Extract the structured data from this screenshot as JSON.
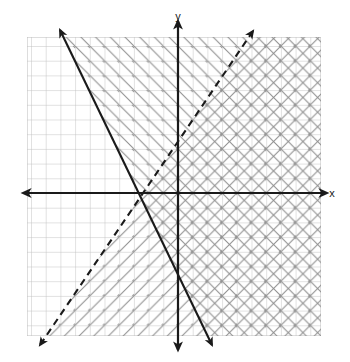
{
  "figure": {
    "title": "",
    "axis_labels": {
      "x": "x",
      "y": "y"
    },
    "background_color": "#ffffff",
    "grid_color": "#b9b9b9",
    "axis_color": "#1a1a1a",
    "shading_color_a": "#8a8a8a",
    "shading_color_b": "#8a8a8a",
    "solid_line_color": "#1a1a1a",
    "dashed_line_color": "#1a1a1a"
  },
  "chart_data": {
    "type": "line",
    "title": "",
    "xlabel": "x",
    "ylabel": "y",
    "grid": true,
    "legend": "none",
    "xlim": [
      -10.3,
      9.7
    ],
    "ylim": [
      -9.75,
      10.6
    ],
    "grid_step": 1,
    "origin_px": {
      "x": 178,
      "y": 193
    },
    "cell_px": 14.7,
    "plot_area_px": {
      "left": 27,
      "top": 37,
      "right": 321,
      "bottom": 336
    },
    "series": [
      {
        "name": "boundary-solid",
        "style": "solid",
        "slope": -2.07,
        "y_intercept": -3.1,
        "x_intercept": -1.5,
        "arrow_start_px": {
          "x": 60,
          "y": 30
        },
        "arrow_end_px": {
          "x": 212,
          "y": 345
        },
        "shading": "right-of-line",
        "hatch_direction": "nw-se",
        "inclusive": true
      },
      {
        "name": "boundary-dashed",
        "style": "dashed",
        "slope": 1.47,
        "y_intercept": 2.6,
        "x_intercept": -1.75,
        "arrow_start_px": {
          "x": 253,
          "y": 31
        },
        "arrow_end_px": {
          "x": 40,
          "y": 345
        },
        "shading": "right-of-line",
        "hatch_direction": "ne-sw",
        "inclusive": false
      }
    ],
    "annotations": [
      {
        "text": "x",
        "px": {
          "x": 332,
          "y": 193
        },
        "role": "x-axis-label"
      },
      {
        "text": "y",
        "px": {
          "x": 178,
          "y": 16
        },
        "role": "y-axis-label"
      }
    ]
  }
}
